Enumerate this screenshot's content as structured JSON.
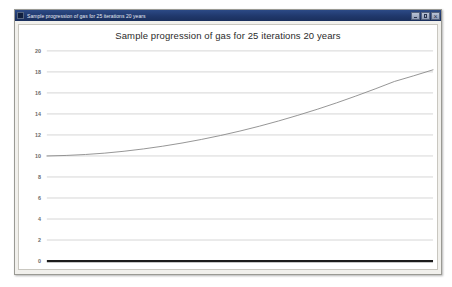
{
  "window": {
    "title": "Sample progression of gas for 25 iterations 20 years",
    "icon": "chart-window-icon",
    "controls": {
      "minimize": "minimize-icon",
      "maximize": "maximize-icon",
      "close": "close-icon"
    }
  },
  "colors": {
    "titlebar_start": "#2c4a86",
    "titlebar_end": "#1a2f5c",
    "titlebar_text": "#e8ecf5",
    "window_bg": "#f1f0ec",
    "plot_bg": "#ffffff",
    "gridline": "#c4c4c4",
    "axis_line": "#1c1c1c",
    "series_line": "#8a8a8a",
    "tick_text": "#6a6a6a",
    "title_text": "#2b2b2b"
  },
  "chart_data": {
    "type": "line",
    "title": "Sample progression of gas for 25 iterations 20 years",
    "xlabel": "",
    "ylabel": "",
    "ylim": [
      0,
      20
    ],
    "xlim": [
      0,
      20
    ],
    "yticks": [
      20,
      18,
      16,
      14,
      12,
      10,
      8,
      6,
      4,
      2,
      0
    ],
    "ytick_labels": [
      "20",
      "18",
      "16",
      "14",
      "12",
      "10",
      "8",
      "6",
      "4",
      "2",
      "0"
    ],
    "xticks": [],
    "xtick_labels": [],
    "grid": true,
    "grid_axis": "y",
    "legend": false,
    "legend_position": "none",
    "series": [
      {
        "name": "gas progression",
        "color": "#8a8a8a",
        "x": [
          0,
          1,
          2,
          3,
          4,
          5,
          6,
          7,
          8,
          9,
          10,
          11,
          12,
          13,
          14,
          15,
          16,
          17,
          18,
          19,
          20
        ],
        "values": [
          10.0,
          10.05,
          10.14,
          10.27,
          10.45,
          10.67,
          10.93,
          11.23,
          11.57,
          11.95,
          12.37,
          12.83,
          13.33,
          13.87,
          14.44,
          15.05,
          15.7,
          16.38,
          17.09,
          17.63,
          18.2
        ]
      }
    ]
  }
}
